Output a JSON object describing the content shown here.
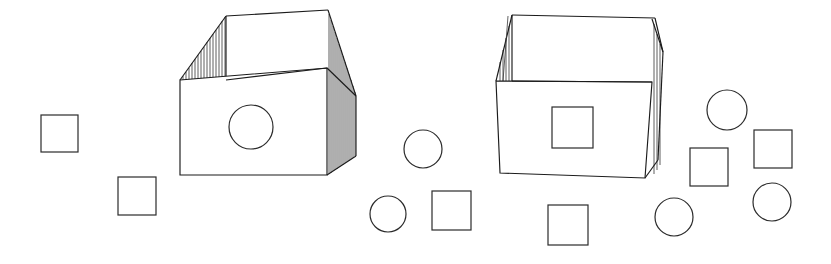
{
  "figure": {
    "title": "Two open boxes with scattered squares and circles",
    "background_color": "#ffffff",
    "line_color": "#1b1b1b",
    "hatch_color": "#2a2a2a",
    "canvas": {
      "width": 831,
      "height": 264
    }
  },
  "boxes": [
    {
      "id": "box-left",
      "label": "Open box with circular hole",
      "front_face_shape": "circle",
      "perspective": "three-quarter view, deep",
      "has_hatched_left_wall": true,
      "has_hatched_right_wall": true,
      "front_face": {
        "x": 180,
        "y": 80,
        "width": 147,
        "height": 95
      },
      "hole": {
        "cx": 251,
        "cy": 127,
        "r": 22
      },
      "rim": {
        "top_left": {
          "x": 226,
          "y": 16
        },
        "top_right": {
          "x": 328,
          "y": 10
        },
        "bottom_right": {
          "x": 327,
          "y": 68
        },
        "bottom_left": {
          "x": 180,
          "y": 80
        }
      },
      "hatch_count_left": 15,
      "hatch_count_right": 14
    },
    {
      "id": "box-right",
      "label": "Open box with square hole",
      "front_face_shape": "square",
      "perspective": "near-frontal, shallow",
      "has_hatched_left_wall": true,
      "has_hatched_right_wall": true,
      "front_face": {
        "x": 496,
        "y": 81,
        "width": 135,
        "height": 97
      },
      "hole": {
        "x": 552,
        "y": 107,
        "width": 41,
        "height": 41
      },
      "rim": {
        "top_left": {
          "x": 512,
          "y": 15
        },
        "top_right": {
          "x": 655,
          "y": 18
        },
        "bottom_right": {
          "x": 652,
          "y": 82
        },
        "bottom_left": {
          "x": 496,
          "y": 81
        }
      },
      "hatch_count_left": 4,
      "hatch_count_right": 3
    }
  ],
  "loose_shapes": [
    {
      "id": "square-1",
      "type": "square",
      "x": 41,
      "y": 115,
      "size": 37
    },
    {
      "id": "square-2",
      "type": "square",
      "x": 118,
      "y": 177,
      "size": 38
    },
    {
      "id": "circle-1",
      "type": "circle",
      "cx": 423,
      "cy": 149,
      "r": 19
    },
    {
      "id": "circle-2",
      "type": "circle",
      "cx": 388,
      "cy": 214,
      "r": 18
    },
    {
      "id": "square-3",
      "type": "square",
      "x": 432,
      "y": 191,
      "size": 39
    },
    {
      "id": "square-4",
      "type": "square",
      "x": 548,
      "y": 205,
      "size": 40
    },
    {
      "id": "circle-3",
      "type": "circle",
      "cx": 674,
      "cy": 217,
      "r": 19
    },
    {
      "id": "circle-4",
      "type": "circle",
      "cx": 727,
      "cy": 110,
      "r": 20
    },
    {
      "id": "square-5",
      "type": "square",
      "x": 690,
      "y": 148,
      "size": 38
    },
    {
      "id": "square-6",
      "type": "square",
      "x": 754,
      "y": 130,
      "size": 38
    },
    {
      "id": "circle-5",
      "type": "circle",
      "cx": 772,
      "cy": 202,
      "r": 19
    }
  ],
  "counts": {
    "boxes": 2,
    "loose_squares": 6,
    "loose_circles": 5
  }
}
